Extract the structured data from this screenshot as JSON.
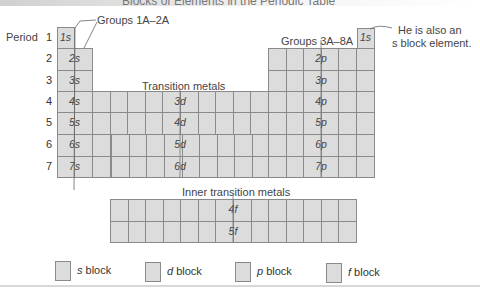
{
  "title": "Blocks of Elements in the Periodic Table",
  "annotations": {
    "groups_1a_2a": "Groups 1A–2A",
    "groups_3a_8a": "Groups 3A–8A",
    "transition_metals": "Transition metals",
    "inner_transition_metals": "Inner transition metals",
    "helium_note_line1": "He is also an",
    "helium_note_line2": "s block element."
  },
  "periods": {
    "label_prefix": "Period",
    "rows": [
      "1",
      "2",
      "3",
      "4",
      "5",
      "6",
      "7"
    ]
  },
  "s_block": {
    "orbitals": [
      "1s",
      "2s",
      "3s",
      "4s",
      "5s",
      "6s",
      "7s"
    ],
    "helium": "1s"
  },
  "d_block": {
    "orbitals": [
      "3d",
      "4d",
      "5d",
      "6d"
    ]
  },
  "p_block": {
    "orbitals": [
      "2p",
      "3p",
      "4p",
      "5p",
      "6p",
      "7p"
    ]
  },
  "f_block": {
    "orbitals": [
      "4f",
      "5f"
    ]
  },
  "legend": [
    {
      "letter": "s",
      "text": " block"
    },
    {
      "letter": "d",
      "text": " block"
    },
    {
      "letter": "p",
      "text": " block"
    },
    {
      "letter": "f",
      "text": " block"
    }
  ],
  "colors": {
    "cell_fill": "#dcdcdc",
    "cell_border": "#8a8a8a"
  }
}
